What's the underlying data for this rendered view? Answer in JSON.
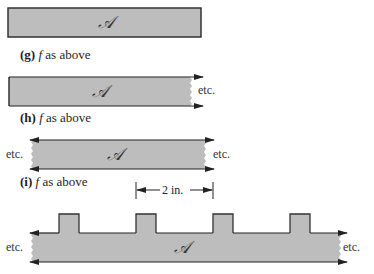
{
  "figure": {
    "colors": {
      "fill": "#bdbdbd",
      "stroke": "#333333",
      "background": "#ffffff"
    },
    "region_symbol": "𝒜",
    "panels": [
      {
        "id": "top",
        "shape": "bounded strip (closed rectangle)",
        "symbol": "𝒜"
      },
      {
        "id": "g",
        "caption_letter": "(g)",
        "caption_text": "as above",
        "caption_func": "f",
        "shape": "half-infinite strip to the right",
        "right_note": "etc.",
        "symbol": "𝒜"
      },
      {
        "id": "h",
        "caption_letter": "(h)",
        "caption_text": "as above",
        "caption_func": "f",
        "shape": "infinite strip both directions",
        "left_note": "etc.",
        "right_note": "etc.",
        "symbol": "𝒜"
      },
      {
        "id": "i",
        "caption_letter": "(i)",
        "caption_text": "as above",
        "caption_func": "f",
        "shape": "infinite strip with periodic square bumps",
        "left_note": "etc.",
        "right_note": "etc.",
        "symbol": "𝒜",
        "period_label": "2 in."
      }
    ]
  }
}
